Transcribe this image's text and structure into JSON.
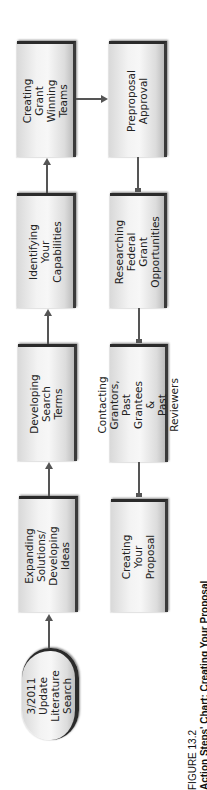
{
  "diagram": {
    "type": "flowchart",
    "orientation": "rotated-90-ccw",
    "nodes": {
      "start": {
        "label": "3/2011 Update\nLiterature Search",
        "shape": "rounded"
      },
      "expanding": {
        "label": "Expanding\nSolutions/\nDeveloping Ideas",
        "shape": "box"
      },
      "developing": {
        "label": "Developing Search\nTerms",
        "shape": "box"
      },
      "identifying": {
        "label": "Identifying Your\nCapabilities",
        "shape": "box"
      },
      "teams": {
        "label": "Creating Grant\nWinning Teams",
        "shape": "box"
      },
      "preproposal": {
        "label": "Preproposal\nApproval",
        "shape": "box"
      },
      "researching": {
        "label": "Researching\nFederal Grant\nOpportunities",
        "shape": "box"
      },
      "contacting": {
        "label": "Contacting Grantors,\nPast Grantees &\nPast Reviewers",
        "shape": "box"
      },
      "proposal": {
        "label": "Creating Your\nProposal",
        "shape": "box"
      }
    },
    "edges": [
      {
        "from": "start",
        "to": "expanding"
      },
      {
        "from": "expanding",
        "to": "developing"
      },
      {
        "from": "developing",
        "to": "identifying"
      },
      {
        "from": "identifying",
        "to": "teams"
      },
      {
        "from": "teams",
        "to": "preproposal"
      },
      {
        "from": "preproposal",
        "to": "researching"
      },
      {
        "from": "researching",
        "to": "contacting"
      },
      {
        "from": "contacting",
        "to": "proposal"
      }
    ],
    "colors": {
      "box_fill": "#f3f3f3",
      "box_shadow": "#2b2b2b",
      "arrow": "#555555",
      "text": "#222222"
    }
  },
  "caption": {
    "figure_number": "FIGURE 13.2",
    "title": "Action Steps' Chart: Creating Your Proposal"
  }
}
